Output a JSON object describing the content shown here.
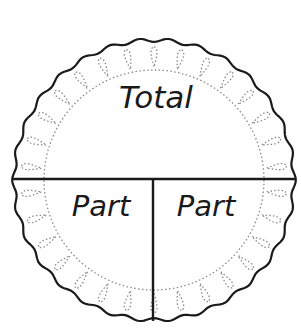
{
  "diagram": {
    "type": "part-part-whole circle",
    "labels": {
      "total": "Total",
      "part_left": "Part",
      "part_right": "Part"
    },
    "colors": {
      "stroke": "#1a1a1a",
      "dotted": "#8a8a8a",
      "background": "#ffffff"
    }
  }
}
